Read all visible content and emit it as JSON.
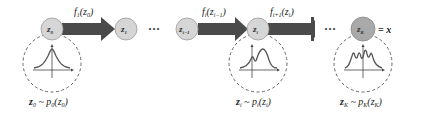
{
  "diagram": {
    "colors": {
      "node_fill": "#d6d6d6",
      "node_fill_final": "#a9a9a9",
      "node_stroke": "#9a9a9a",
      "arrow": "#4a4a4a",
      "dashed": "#555555",
      "curve": "#555555"
    },
    "nodes": [
      {
        "id": "z0",
        "label": "z",
        "sub": "0"
      },
      {
        "id": "z1",
        "label": "z",
        "sub": "1"
      },
      {
        "id": "zim1",
        "label": "z",
        "sub": "i−1"
      },
      {
        "id": "zi",
        "label": "z",
        "sub": "i"
      },
      {
        "id": "zK",
        "label": "z",
        "sub": "K"
      }
    ],
    "ellipses": [
      "···",
      "···"
    ],
    "final_equals": "= x",
    "arrows": [
      {
        "from": "z0",
        "to": "z1",
        "label": "f",
        "label_sub": "1",
        "arg": "(z",
        "arg_sub": "0",
        "close": ")"
      },
      {
        "from": "zim1",
        "to": "zi",
        "label": "f",
        "label_sub": "i",
        "arg": "(z",
        "arg_sub": "i−1",
        "close": ")"
      },
      {
        "from": "zi",
        "to": "…",
        "label": "f",
        "label_sub": "i+1",
        "arg": "(z",
        "arg_sub": "i",
        "close": ")"
      }
    ],
    "distributions": [
      {
        "node": "z0",
        "shape": "unimodal",
        "caption": {
          "lhs": "z",
          "lhs_sub": "0",
          "rel": " ~ ",
          "p": "p",
          "p_sub": "0",
          "arg": "(z",
          "arg_sub": "0",
          "close": ")"
        }
      },
      {
        "node": "zi",
        "shape": "bimodal",
        "caption": {
          "lhs": "z",
          "lhs_sub": "i",
          "rel": " ~ ",
          "p": "p",
          "p_sub": "i",
          "arg": "(z",
          "arg_sub": "i",
          "close": ")"
        }
      },
      {
        "node": "zK",
        "shape": "multimodal",
        "caption": {
          "lhs": "z",
          "lhs_sub": "K",
          "rel": " ~ ",
          "p": "p",
          "p_sub": "K",
          "arg": "(z",
          "arg_sub": "K",
          "close": ")"
        }
      }
    ]
  }
}
